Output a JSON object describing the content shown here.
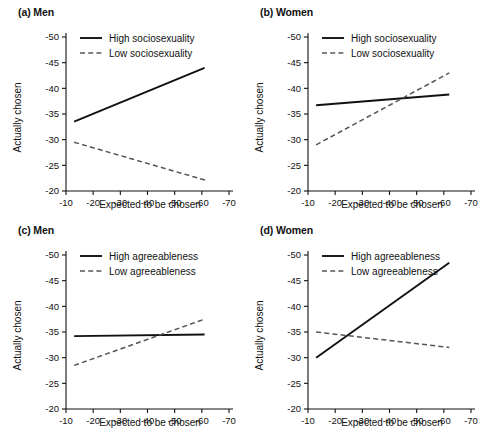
{
  "figure": {
    "axis": {
      "xlabel": "Expected to be chosen",
      "ylabel": "Actually chosen",
      "xticks": [
        "-10",
        "-20",
        "-30",
        "-40",
        "-50",
        "-60",
        "-70"
      ],
      "yticks": [
        "-50",
        "-45",
        "-40",
        "-35",
        "-30",
        "-25",
        "-20"
      ],
      "xlim": [
        -10,
        -70
      ],
      "ylim": [
        -20,
        -50
      ],
      "grid": false,
      "legend_position": "top-left inside axes"
    },
    "colors": {
      "high_line": "#111111",
      "low_line": "#555555",
      "background": "#ffffff",
      "axis": "#111111"
    },
    "panels": [
      {
        "id": "a",
        "label": "(a) Men",
        "tag": "(a)",
        "group": "Men",
        "legend": [
          "High sociosexuality",
          "Low sociosexuality"
        ],
        "series": [
          {
            "name": "High sociosexuality",
            "style": "solid",
            "x": [
              -13,
              -61
            ],
            "y": [
              -33.5,
              -44.0
            ]
          },
          {
            "name": "Low sociosexuality",
            "style": "dashed",
            "x": [
              -13,
              -62
            ],
            "y": [
              -29.5,
              -22.0
            ]
          }
        ]
      },
      {
        "id": "b",
        "label": "(b) Women",
        "tag": "(b)",
        "group": "Women",
        "legend": [
          "High sociosexuality",
          "Low sociosexuality"
        ],
        "series": [
          {
            "name": "High sociosexuality",
            "style": "solid",
            "x": [
              -13,
              -62
            ],
            "y": [
              -36.7,
              -38.8
            ]
          },
          {
            "name": "Low sociosexuality",
            "style": "dashed",
            "x": [
              -13,
              -62
            ],
            "y": [
              -29.0,
              -43.0
            ]
          }
        ]
      },
      {
        "id": "c",
        "label": "(c) Men",
        "tag": "(c)",
        "group": "Men",
        "legend": [
          "High agreeableness",
          "Low agreeableness"
        ],
        "series": [
          {
            "name": "High agreeableness",
            "style": "solid",
            "x": [
              -13,
              -61
            ],
            "y": [
              -34.2,
              -34.5
            ]
          },
          {
            "name": "Low agreeableness",
            "style": "dashed",
            "x": [
              -13,
              -61
            ],
            "y": [
              -28.5,
              -37.5
            ]
          }
        ]
      },
      {
        "id": "d",
        "label": "(d) Women",
        "tag": "(d)",
        "group": "Women",
        "legend": [
          "High agreeableness",
          "Low agreeableness"
        ],
        "series": [
          {
            "name": "High agreeableness",
            "style": "solid",
            "x": [
              -13,
              -62
            ],
            "y": [
              -30.0,
              -48.5
            ]
          },
          {
            "name": "Low agreeableness",
            "style": "dashed",
            "x": [
              -13,
              -62
            ],
            "y": [
              -35.0,
              -32.0
            ]
          }
        ]
      }
    ]
  },
  "chart_data": [
    {
      "type": "line",
      "title": "(a) Men",
      "xlabel": "Expected to be chosen",
      "ylabel": "Actually chosen",
      "xlim": [
        -10,
        -70
      ],
      "ylim": [
        -20,
        -50
      ],
      "x_inverted": true,
      "y_inverted": true,
      "grid": false,
      "legend": [
        "High sociosexuality",
        "Low sociosexuality"
      ],
      "series": [
        {
          "name": "High sociosexuality",
          "x": [
            -13,
            -61
          ],
          "values": [
            -33.5,
            -44.0
          ],
          "style": "solid"
        },
        {
          "name": "Low sociosexuality",
          "x": [
            -13,
            -62
          ],
          "values": [
            -29.5,
            -22.0
          ],
          "style": "dashed"
        }
      ]
    },
    {
      "type": "line",
      "title": "(b) Women",
      "xlabel": "Expected to be chosen",
      "ylabel": "Actually chosen",
      "xlim": [
        -10,
        -70
      ],
      "ylim": [
        -20,
        -50
      ],
      "x_inverted": true,
      "y_inverted": true,
      "grid": false,
      "legend": [
        "High sociosexuality",
        "Low sociosexuality"
      ],
      "series": [
        {
          "name": "High sociosexuality",
          "x": [
            -13,
            -62
          ],
          "values": [
            -36.7,
            -38.8
          ],
          "style": "solid"
        },
        {
          "name": "Low sociosexuality",
          "x": [
            -13,
            -62
          ],
          "values": [
            -29.0,
            -43.0
          ],
          "style": "dashed"
        }
      ]
    },
    {
      "type": "line",
      "title": "(c) Men",
      "xlabel": "Expected to be chosen",
      "ylabel": "Actually chosen",
      "xlim": [
        -10,
        -70
      ],
      "ylim": [
        -20,
        -50
      ],
      "x_inverted": true,
      "y_inverted": true,
      "grid": false,
      "legend": [
        "High agreeableness",
        "Low agreeableness"
      ],
      "series": [
        {
          "name": "High agreeableness",
          "x": [
            -13,
            -61
          ],
          "values": [
            -34.2,
            -34.5
          ],
          "style": "solid"
        },
        {
          "name": "Low agreeableness",
          "x": [
            -13,
            -61
          ],
          "values": [
            -28.5,
            -37.5
          ],
          "style": "dashed"
        }
      ]
    },
    {
      "type": "line",
      "title": "(d) Women",
      "xlabel": "Expected to be chosen",
      "ylabel": "Actually chosen",
      "xlim": [
        -10,
        -70
      ],
      "ylim": [
        -20,
        -50
      ],
      "x_inverted": true,
      "y_inverted": true,
      "grid": false,
      "legend": [
        "High agreeableness",
        "Low agreeableness"
      ],
      "series": [
        {
          "name": "High agreeableness",
          "x": [
            -13,
            -62
          ],
          "values": [
            -30.0,
            -48.5
          ],
          "style": "solid"
        },
        {
          "name": "Low agreeableness",
          "x": [
            -13,
            -62
          ],
          "values": [
            -35.0,
            -32.0
          ],
          "style": "dashed"
        }
      ]
    }
  ]
}
